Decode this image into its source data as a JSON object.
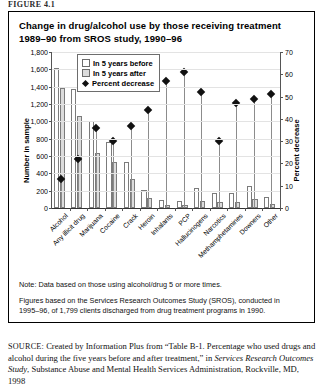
{
  "page": {
    "cropped_caption": "FIGURE 4.1"
  },
  "figure": {
    "title_line1": "Change in drug/alcohol use by those receiving treatment",
    "title_line2": "1989–90 from SROS study, 1990–96",
    "note_line1": "Note: Data based on those using alcohol/drug 5 or more times.",
    "note_line2": "Figures based on the Services Research Outcomes Study (SROS), conducted in",
    "note_line3": "1995–96, of 1,799 clients discharged from drug treatment programs in 1990.",
    "source_label": "SOURCE:",
    "source_text_1": " Created by Information Plus from “Table B-1. Percentage who used drugs and alcohol during the five years before and after treatment,” in ",
    "source_italic": "Services Research Outcomes Study",
    "source_text_2": ", Substance Abuse and Mental Health Services Administration, Rockville, MD, 1998"
  },
  "chart_data": {
    "type": "bar",
    "title": "Change in drug/alcohol use by those receiving treatment 1989–90 from SROS study, 1990–96",
    "xlabel": "",
    "ylabel": "Number in sample",
    "y2label": "Percent decrease",
    "ylim": [
      0,
      1800
    ],
    "y2lim": [
      0,
      70
    ],
    "yticks": [
      "0",
      "200",
      "400",
      "600",
      "800",
      "1,000",
      "1,200",
      "1,400",
      "1,600",
      "1,800"
    ],
    "y2ticks": [
      "0",
      "10",
      "20",
      "30",
      "40",
      "50",
      "60",
      "70"
    ],
    "grid": true,
    "legend_position": "top-left-inside",
    "legend": [
      "In 5 years before",
      "In 5 years after",
      "Percent decrease"
    ],
    "categories": [
      "Alcohol",
      "Any illicit drug",
      "Marijuana",
      "Cocaine",
      "Crack",
      "Heroin",
      "Inhalants",
      "PCP",
      "Hallucinogens",
      "Narcotics",
      "Methamphetamines",
      "Downers",
      "Other"
    ],
    "series": [
      {
        "name": "In 5 years before",
        "axis": "left",
        "values": [
          1620,
          1370,
          1000,
          760,
          530,
          210,
          95,
          80,
          230,
          175,
          175,
          250,
          130
        ]
      },
      {
        "name": "In 5 years after",
        "axis": "left",
        "values": [
          1390,
          1060,
          640,
          530,
          330,
          120,
          40,
          30,
          85,
          70,
          65,
          100,
          50
        ]
      },
      {
        "name": "Percent decrease",
        "axis": "right",
        "values": [
          13,
          22,
          36,
          30,
          37,
          44,
          57,
          61,
          52,
          30,
          47,
          49,
          51
        ]
      }
    ]
  }
}
